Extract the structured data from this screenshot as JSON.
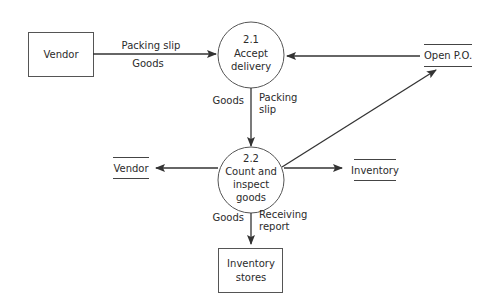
{
  "diagram": {
    "type": "data-flow-diagram",
    "external_entities": [
      {
        "id": "vendor",
        "label": "Vendor"
      }
    ],
    "processes": [
      {
        "id": "p21",
        "number": "2.1",
        "line1": "Accept",
        "line2": "delivery"
      },
      {
        "id": "p22",
        "number": "2.2",
        "line1": "Count and",
        "line2": "inspect",
        "line3": "goods"
      }
    ],
    "data_stores": [
      {
        "id": "open_po",
        "label": "Open P.O."
      },
      {
        "id": "vendor_store",
        "label": "Vendor"
      },
      {
        "id": "inventory_store",
        "label": "Inventory"
      },
      {
        "id": "inventory_stores",
        "line1": "Inventory",
        "line2": "stores"
      }
    ],
    "flows": [
      {
        "from": "vendor",
        "to": "p21",
        "label1": "Packing slip",
        "label2": "Goods"
      },
      {
        "from": "open_po",
        "to": "p21",
        "label1": ""
      },
      {
        "from": "p21",
        "to": "p22",
        "left_label": "Goods",
        "right_label1": "Packing",
        "right_label2": "slip"
      },
      {
        "from": "p22",
        "to": "open_po",
        "label1": ""
      },
      {
        "from": "p22",
        "to": "vendor_store",
        "label1": ""
      },
      {
        "from": "p22",
        "to": "inventory_store",
        "label1": ""
      },
      {
        "from": "p22",
        "to": "inventory_stores",
        "left_label": "Goods",
        "right_label1": "Receiving",
        "right_label2": "report"
      }
    ]
  }
}
